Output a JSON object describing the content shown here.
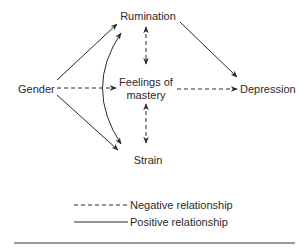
{
  "nodes": {
    "gender": "Gender",
    "rumination": "Rumination",
    "mastery_line1": "Feelings of",
    "mastery_line2": "mastery",
    "depression": "Depression",
    "strain": "Strain"
  },
  "edges": [
    {
      "from": "Gender",
      "to": "Rumination",
      "type": "positive",
      "style": "solid"
    },
    {
      "from": "Gender",
      "to": "Strain",
      "type": "positive",
      "style": "solid"
    },
    {
      "from": "Gender",
      "to": "Feelings of mastery",
      "type": "negative",
      "style": "dashed"
    },
    {
      "from": "Rumination",
      "to": "Strain",
      "type": "positive",
      "style": "solid curved bidirectional"
    },
    {
      "from": "Rumination",
      "to": "Feelings of mastery",
      "type": "negative",
      "style": "dashed bidirectional"
    },
    {
      "from": "Feelings of mastery",
      "to": "Strain",
      "type": "negative",
      "style": "dashed bidirectional"
    },
    {
      "from": "Rumination",
      "to": "Depression",
      "type": "positive",
      "style": "solid"
    },
    {
      "from": "Feelings of mastery",
      "to": "Depression",
      "type": "negative",
      "style": "dashed"
    }
  ],
  "legend": {
    "negative": "Negative relationship",
    "positive": "Positive relationship"
  },
  "colors": {
    "line": "#2a2a2a",
    "text": "#2a2a2a",
    "rule": "#7a7a7a"
  }
}
